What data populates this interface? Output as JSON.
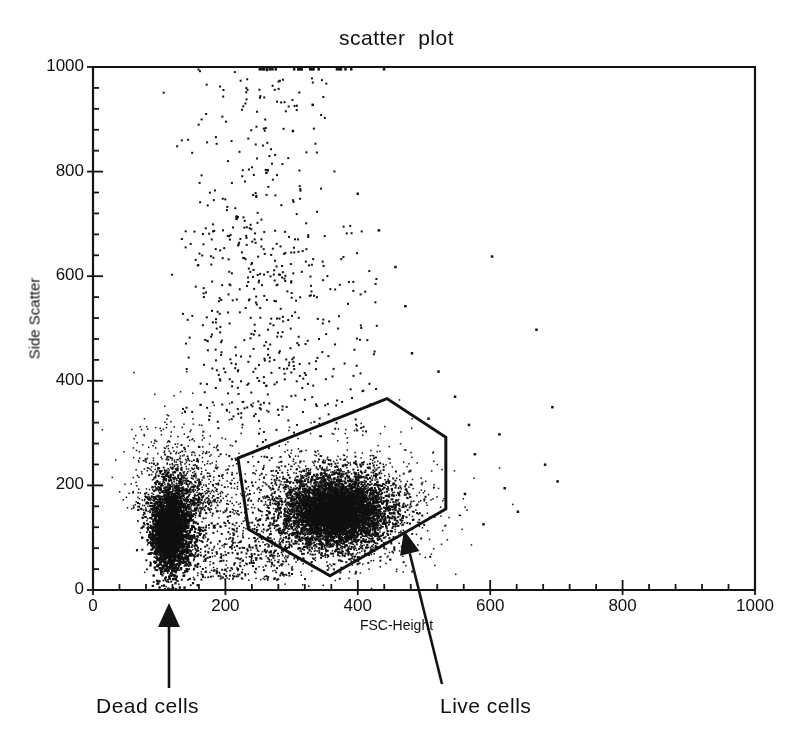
{
  "chart_data": {
    "type": "scatter",
    "title": "scatter  plot",
    "xlabel": "FSC-Height",
    "ylabel": "Side Scatter",
    "xlim": [
      0,
      1000
    ],
    "ylim": [
      0,
      1000
    ],
    "xticks": [
      0,
      200,
      400,
      600,
      800,
      1000
    ],
    "yticks": [
      0,
      200,
      400,
      600,
      800,
      1000
    ],
    "xtick_labels": [
      "0",
      "200",
      "400",
      "600",
      "800",
      "1000"
    ],
    "ytick_labels": [
      "0",
      "200",
      "400",
      "600",
      "800",
      "1000"
    ],
    "minor_ticks_per_interval": 4,
    "grid": false,
    "legend": null,
    "marker": {
      "color": "#101010",
      "size": 2,
      "shape": "square"
    },
    "populations": [
      {
        "name": "Dead cells",
        "description": "dense low-FSC low-SSC cluster at the left edge",
        "center": [
          118,
          125
        ],
        "x_range": [
          55,
          185
        ],
        "y_range": [
          0,
          330
        ],
        "n_points": 4200,
        "density": "saturated"
      },
      {
        "name": "Live cells",
        "description": "dense mid-FSC low-SSC cluster inside the polygon gate",
        "center": [
          370,
          155
        ],
        "x_range": [
          245,
          545
        ],
        "y_range": [
          30,
          300
        ],
        "n_points": 4600,
        "density": "saturated"
      },
      {
        "name": "Bridge / debris",
        "description": "diffuse points between the two clusters",
        "center": [
          210,
          170
        ],
        "x_range": [
          150,
          300
        ],
        "y_range": [
          20,
          400
        ],
        "n_points": 700,
        "density": "sparse"
      },
      {
        "name": "High side-scatter tail",
        "description": "vertical stream of sparse events rising to the top of the plot",
        "center": [
          250,
          600
        ],
        "x_range": [
          150,
          420
        ],
        "y_range": [
          330,
          1000
        ],
        "n_points": 320,
        "density": "very sparse"
      },
      {
        "name": "Saturation line",
        "description": "events piled on the upper boundary at SSC = 1000",
        "center": [
          330,
          1000
        ],
        "x_range": [
          250,
          450
        ],
        "y_range": [
          995,
          1000
        ],
        "n_points": 22,
        "density": "line"
      },
      {
        "name": "Far outliers",
        "description": "isolated events scattered to the right of the gate",
        "center": [
          680,
          250
        ],
        "x_range": [
          560,
          950
        ],
        "y_range": [
          100,
          700
        ],
        "n_points": 24,
        "density": "isolated"
      }
    ],
    "gate": {
      "name": "Live cells gate",
      "shape": "polygon",
      "closed": true,
      "line_color": "#101010",
      "line_width": 3,
      "vertices": [
        [
          219,
          252
        ],
        [
          444,
          366
        ],
        [
          533,
          292
        ],
        [
          533,
          155
        ],
        [
          358,
          27
        ],
        [
          235,
          116
        ]
      ]
    },
    "annotations": [
      {
        "label": "Dead cells",
        "arrow": "vertical",
        "points_to": [
          115,
          0
        ],
        "text_position": [
          96,
          694
        ]
      },
      {
        "label": "Live cells",
        "arrow": "diagonal",
        "points_to": [
          475,
          75
        ],
        "text_position": [
          440,
          694
        ]
      }
    ]
  },
  "chart": {
    "title": "scatter  plot",
    "x_axis_title": "FSC-Height",
    "y_axis_title": "Side Scatter",
    "x_tick_labels": [
      "0",
      "200",
      "400",
      "600",
      "800",
      "1000"
    ],
    "y_tick_labels": [
      "0",
      "200",
      "400",
      "600",
      "800",
      "1000"
    ],
    "annotation_dead": "Dead cells",
    "annotation_live": "Live cells",
    "colors": {
      "point": "#101010",
      "axis": "#141414",
      "gate": "#101010",
      "background": "#ffffff"
    }
  }
}
